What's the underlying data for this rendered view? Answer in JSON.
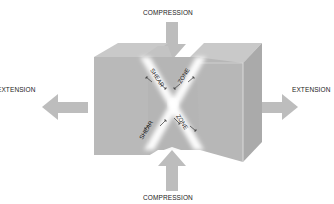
{
  "labels": {
    "compression_top": "COMPRESSION",
    "compression_bottom": "COMPRESSION",
    "extension_left": "EXTENSION",
    "extension_right": "EXTENSION",
    "shear_upper": "SHEAR",
    "zone_upper": "ZONE",
    "shear_lower": "SHEAR",
    "zone_lower": "ZONE"
  },
  "colors": {
    "block_front": "#b9b9b9",
    "block_top": "#c9c9c9",
    "block_side": "#a9a9a9",
    "arrow": "#bdbdbd",
    "shear_glow": "#ffffff",
    "text": "#222222"
  }
}
